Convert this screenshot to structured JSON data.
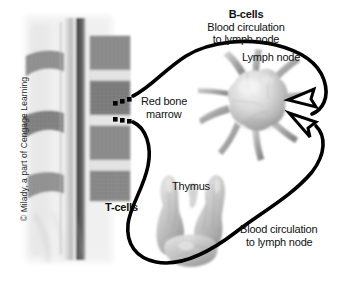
{
  "figure": {
    "background_color": "#ffffff",
    "ink_color": "#000000"
  },
  "labels": {
    "b_cells": "B-cells",
    "b_cells_line2": "Blood circulation",
    "b_cells_line3": "to lymph node",
    "lymph_node": "Lymph node",
    "red_bone_marrow_line1": "Red bone",
    "red_bone_marrow_line2": "marrow",
    "t_cells": "T-cells",
    "thymus": "Thymus",
    "t_cells_line2": "Blood circulation",
    "t_cells_line3": "to lymph node"
  },
  "credit": {
    "text": "© Milady, a part of Cengage Learning"
  },
  "bottom_caption": {
    "text": ""
  },
  "anatomy": {
    "spine": "spinal-column-cross-section",
    "lymph_node": "lymph-node-organ",
    "thymus": "thymus-organ",
    "marrow_markers": "red-bone-marrow-leader-dots"
  },
  "flow": {
    "b_cell_path": "marrow-to-lymph-node-upper-arrow",
    "t_cell_path": "marrow-through-thymus-to-lymph-node-lower-arrow",
    "arrowhead_style": "hollow-triangle"
  }
}
